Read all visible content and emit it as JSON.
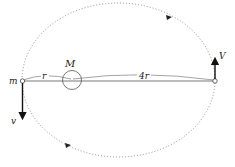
{
  "diagram": {
    "type": "elliptical-orbit",
    "labels": {
      "planet_mass": "m",
      "star_mass": "M",
      "near_distance": "r",
      "far_distance": "4r",
      "near_velocity": "v",
      "far_velocity": "V"
    },
    "colors": {
      "stroke": "#555555",
      "orbit": "#777777",
      "arrow": "#111111",
      "text": "#222222"
    }
  }
}
